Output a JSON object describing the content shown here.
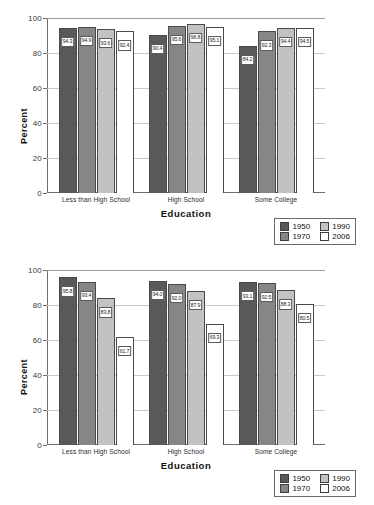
{
  "charts": [
    {
      "name": "chart-top",
      "chart_data": {
        "type": "bar",
        "title": "",
        "xlabel": "Education",
        "ylabel": "Percent",
        "ylim": [
          0,
          100
        ],
        "yticks": [
          0,
          20,
          40,
          60,
          80,
          100
        ],
        "grid": true,
        "legend_position": "bottom-right",
        "categories": [
          "Less than High School",
          "High School",
          "Some College"
        ],
        "series": [
          {
            "name": "1950",
            "color": "#595959",
            "values": [
              94.3,
              90.4,
              84.2
            ]
          },
          {
            "name": "1970",
            "color": "#868686",
            "values": [
              94.9,
              95.6,
              92.3
            ]
          },
          {
            "name": "1990",
            "color": "#c2c2c2",
            "values": [
              93.6,
              96.8,
              94.4
            ]
          },
          {
            "name": "2006",
            "color": "#ffffff",
            "values": [
              92.4,
              95.1,
              94.5
            ]
          }
        ]
      }
    },
    {
      "name": "chart-bottom",
      "chart_data": {
        "type": "bar",
        "title": "",
        "xlabel": "Education",
        "ylabel": "Percent",
        "ylim": [
          0,
          100
        ],
        "yticks": [
          0,
          20,
          40,
          60,
          80,
          100
        ],
        "grid": true,
        "legend_position": "bottom-right",
        "categories": [
          "Less than High School",
          "High School",
          "Some College"
        ],
        "series": [
          {
            "name": "1950",
            "color": "#595959",
            "values": [
              95.8,
              94.0,
              93.1
            ]
          },
          {
            "name": "1970",
            "color": "#868686",
            "values": [
              93.4,
              92.0,
              92.5
            ]
          },
          {
            "name": "1990",
            "color": "#c2c2c2",
            "values": [
              83.8,
              87.9,
              88.3
            ]
          },
          {
            "name": "2006",
            "color": "#ffffff",
            "values": [
              61.7,
              69.3,
              80.5
            ]
          }
        ]
      }
    }
  ]
}
